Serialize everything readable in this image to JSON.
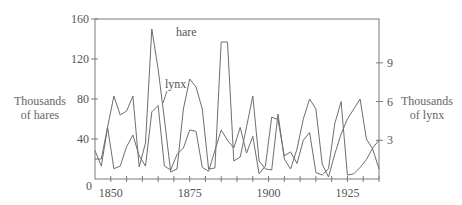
{
  "chart_data": {
    "type": "line",
    "title": "",
    "xlabel": "",
    "x_ticks": [
      1850,
      1875,
      1900,
      1925
    ],
    "x_range": [
      1845,
      1935
    ],
    "y_left": {
      "label_line1": "Thousands",
      "label_line2": "of hares",
      "ticks": [
        0,
        40,
        80,
        120,
        160
      ],
      "range": [
        0,
        160
      ]
    },
    "y_right": {
      "label_line1": "Thousands",
      "label_line2": "of lynx",
      "ticks": [
        3,
        6,
        9
      ],
      "range": [
        0,
        12.4
      ]
    },
    "grid": false,
    "legend": "inline labels",
    "x": [
      1845,
      1847,
      1849,
      1851,
      1853,
      1855,
      1857,
      1859,
      1861,
      1863,
      1865,
      1867,
      1869,
      1871,
      1873,
      1875,
      1877,
      1879,
      1881,
      1883,
      1885,
      1887,
      1889,
      1891,
      1893,
      1895,
      1897,
      1899,
      1901,
      1903,
      1905,
      1907,
      1909,
      1911,
      1913,
      1915,
      1917,
      1919,
      1921,
      1923,
      1925,
      1927,
      1929,
      1931,
      1933,
      1935
    ],
    "series": [
      {
        "name": "hare",
        "axis": "left",
        "label": "hare",
        "values": [
          20,
          20,
          52,
          83,
          64,
          68,
          83,
          12,
          36,
          150,
          110,
          60,
          7,
          10,
          70,
          100,
          92,
          70,
          10,
          11,
          137,
          137,
          18,
          22,
          52,
          83,
          18,
          10,
          9,
          65,
          20,
          10,
          30,
          60,
          80,
          70,
          15,
          2,
          25,
          45,
          60,
          70,
          80,
          40,
          30,
          10
        ]
      },
      {
        "name": "lynx",
        "axis": "right",
        "label": "lynx",
        "values": [
          2.2,
          1.0,
          4.0,
          0.8,
          1.0,
          2.5,
          3.4,
          1.8,
          1.0,
          5.2,
          5.7,
          1.0,
          0.7,
          1.9,
          2.4,
          3.8,
          3.7,
          0.9,
          0.6,
          2.2,
          3.8,
          3.0,
          2.4,
          4.0,
          2.0,
          3.3,
          0.4,
          1.0,
          4.8,
          4.6,
          1.8,
          2.1,
          1.2,
          3.0,
          3.6,
          0.5,
          0.3,
          0.8,
          4.3,
          6.0,
          0.3,
          0.4,
          0.9,
          1.5,
          2.4,
          3.0
        ]
      }
    ]
  },
  "annotations": {
    "hare_label": "hare",
    "lynx_label": "lynx",
    "origin_label": "0"
  }
}
